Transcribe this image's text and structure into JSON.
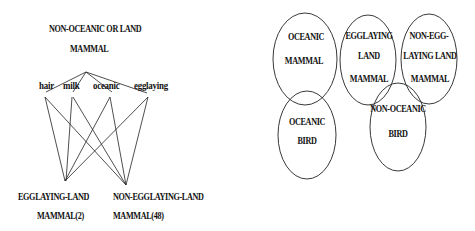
{
  "left_diagram": {
    "top_node": {
      "line1": "NON-OCEANIC OR LAND",
      "line2": "MAMMAL"
    },
    "attributes": [
      "hair",
      "milk",
      "oceanic",
      "egglaying"
    ],
    "bottom_nodes": [
      {
        "line1": "EGGLAYING-LAND",
        "line2": "MAMMAL(2)"
      },
      {
        "line1": "NON-EGGLAYING-LAND",
        "line2": "MAMMAL(48)"
      }
    ]
  },
  "right_diagram": {
    "sets": [
      {
        "line1": "OCEANIC",
        "line2": "MAMMAL"
      },
      {
        "line1": "EGGLAYING",
        "line2": "LAND",
        "line3": "MAMMAL"
      },
      {
        "line1": "NON-EGG-",
        "line2": "LAYING LAND",
        "line3": "MAMMAL"
      },
      {
        "line1": "OCEANIC",
        "line2": "BIRD"
      },
      {
        "line1": "NON-OCEANIC",
        "line2": "BIRD"
      }
    ]
  },
  "colors": {
    "stroke": "#222222",
    "background": "#ffffff"
  }
}
